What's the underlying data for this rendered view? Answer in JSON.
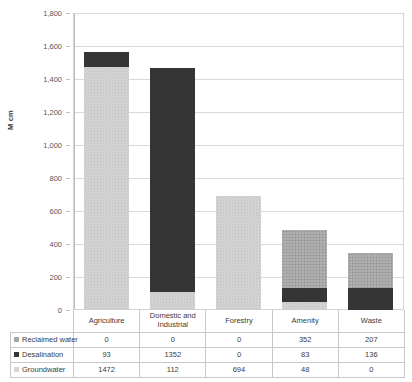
{
  "chart_data": {
    "type": "bar",
    "subtype": "stacked-bar",
    "title": "",
    "xlabel": "",
    "ylabel": "M cm",
    "ylim": [
      0,
      1800
    ],
    "ytick_step": 200,
    "yticks": [
      "0",
      "200",
      "400",
      "600",
      "800",
      "1,000",
      "1,200",
      "1,400",
      "1,600",
      "1,800"
    ],
    "grid": true,
    "legend_position": "data-table-left",
    "categories": [
      "Agriculture",
      "Domestic and Industrial",
      "Forestry",
      "Amenity",
      "Waste"
    ],
    "series": [
      {
        "name": "Reclaimed water",
        "values": [
          0,
          0,
          0,
          352,
          207
        ],
        "color": "#a8a8a8",
        "pattern": "checkered",
        "stack_order": 3
      },
      {
        "name": "Desalination",
        "values": [
          93,
          1352,
          0,
          83,
          136
        ],
        "color": "#353535",
        "pattern": "solid",
        "stack_order": 2
      },
      {
        "name": "Groundwater",
        "values": [
          1472,
          112,
          694,
          48,
          0
        ],
        "color": "#d5d5d5",
        "pattern": "dotted",
        "stack_order": 1
      }
    ],
    "totals": [
      1565,
      1464,
      694,
      483,
      343
    ]
  },
  "axis": {
    "y_title": "M cm"
  },
  "data_table": {
    "column_headers": [
      "Agriculture",
      "Domestic and Industrial",
      "Forestry",
      "Amenity",
      "Waste"
    ],
    "rows": [
      {
        "label": "Reclaimed water",
        "values": [
          "0",
          "0",
          "0",
          "352",
          "207"
        ]
      },
      {
        "label": "Desalination",
        "values": [
          "93",
          "1352",
          "0",
          "83",
          "136"
        ]
      },
      {
        "label": "Groundwater",
        "values": [
          "1472",
          "112",
          "694",
          "48",
          "0"
        ]
      }
    ]
  },
  "colors": {
    "groundwater": "#d5d5d5",
    "desalination": "#353535",
    "reclaimed_water": "#a8a8a8",
    "gridline": "#d9d9d9",
    "border": "#c8c8c8"
  }
}
